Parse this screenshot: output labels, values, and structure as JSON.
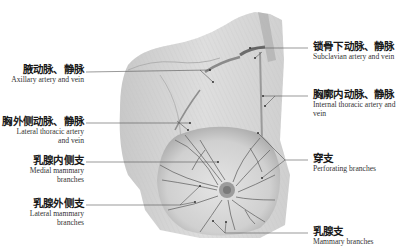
{
  "labels": {
    "axillary": {
      "zh": "腋动脉、静脉",
      "en": "Axillary artery and vein"
    },
    "lateral_thoracic": {
      "zh": "胸外侧动脉、静脉",
      "en_line1": "Lateral thoracic artery",
      "en_line2": "and vein"
    },
    "medial_mammary": {
      "zh": "乳腺内侧支",
      "en_line1": "Medial mammary",
      "en_line2": "branches"
    },
    "lateral_mammary": {
      "zh": "乳腺外侧支",
      "en_line1": "Lateral mammary",
      "en_line2": "branches"
    },
    "subclavian": {
      "zh": "锁骨下动脉、静脉",
      "en": "Subclavian artery and vein"
    },
    "internal_thoracic": {
      "zh": "胸廓内动脉、静脉",
      "en_line1": "Internal thoracic artery and",
      "en_line2": "vein"
    },
    "perforating": {
      "zh": "穿支",
      "en": "Perforating branches"
    },
    "mammary": {
      "zh": "乳腺支",
      "en": "Mammary branches"
    }
  },
  "colors": {
    "background": "#ffffff",
    "skin_light": "#e6e6e6",
    "skin_mid": "#c9c9c9",
    "vessel": "#6a6a6a",
    "leader": "#555555"
  }
}
